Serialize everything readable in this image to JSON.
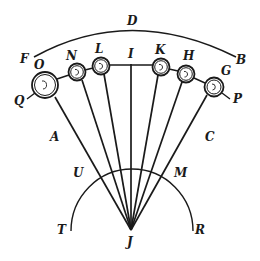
{
  "diagram": {
    "type": "geometric-figure",
    "stroke_color": "#1a1a1a",
    "background": "#ffffff",
    "labels": {
      "D": "D",
      "F": "F",
      "B": "B",
      "O": "O",
      "N": "N",
      "L": "L",
      "I": "I",
      "K": "K",
      "H": "H",
      "G": "G",
      "Q": "Q",
      "P": "P",
      "A": "A",
      "C": "C",
      "U": "U",
      "M": "M",
      "T": "T",
      "R": "R",
      "J": "J"
    },
    "circles": [
      {
        "name": "O",
        "cx": 45,
        "cy": 85,
        "r": 13
      },
      {
        "name": "N",
        "cx": 77,
        "cy": 72,
        "r": 8.5
      },
      {
        "name": "L",
        "cx": 101,
        "cy": 66,
        "r": 8.5
      },
      {
        "name": "K",
        "cx": 161,
        "cy": 67,
        "r": 8.5
      },
      {
        "name": "H",
        "cx": 186,
        "cy": 74,
        "r": 8.5
      },
      {
        "name": "G",
        "cx": 214,
        "cy": 87,
        "r": 9.5
      }
    ],
    "apex": {
      "name": "J",
      "x": 131,
      "y": 230
    }
  }
}
